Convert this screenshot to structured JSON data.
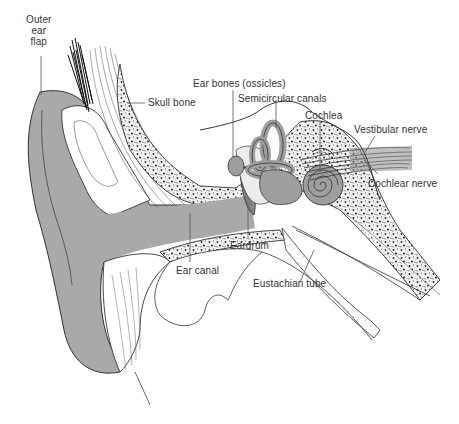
{
  "diagram": {
    "colors": {
      "skin_fill": "#a9a9a9",
      "inner_ear_fill": "#9e9e9e",
      "line": "#333333",
      "bone_speckle": "#222222",
      "label_text": "#333333",
      "background": "#ffffff"
    },
    "labels": [
      {
        "id": "outer-ear-flap",
        "text": "Outer\near\nflap",
        "lines": [
          "Outer",
          "ear",
          "flap"
        ]
      },
      {
        "id": "skull-bone",
        "text": "Skull bone"
      },
      {
        "id": "ear-bones",
        "text": "Ear bones (ossicles)"
      },
      {
        "id": "semicircular-canals",
        "text": "Semicircular canals"
      },
      {
        "id": "cochlea",
        "text": "Cochlea"
      },
      {
        "id": "vestibular-nerve",
        "text": "Vestibular nerve"
      },
      {
        "id": "cochlear-nerve",
        "text": "Cochlear nerve"
      },
      {
        "id": "eardrum",
        "text": "Eardrum"
      },
      {
        "id": "ear-canal",
        "text": "Ear canal"
      },
      {
        "id": "eustachian-tube",
        "text": "Eustachian tube"
      }
    ]
  }
}
